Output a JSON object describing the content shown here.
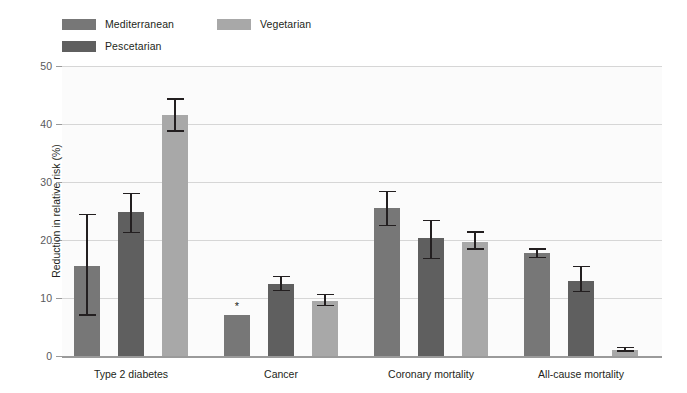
{
  "chart_data": {
    "type": "bar",
    "title": "",
    "xlabel": "",
    "ylabel": "Reduction in relative risk (%)",
    "ylim": [
      0,
      50
    ],
    "yticks": [
      0,
      10,
      20,
      30,
      40,
      50
    ],
    "ytick_labels": [
      "0",
      "10",
      "20",
      "30",
      "40",
      "50"
    ],
    "grid": true,
    "legend_position": "top-left",
    "categories": [
      "Type 2 diabetes",
      "Cancer",
      "Coronary mortality",
      "All-cause mortality"
    ],
    "series": [
      {
        "name": "Mediterranean",
        "color": "#777777",
        "values": [
          15.5,
          7.0,
          25.5,
          17.8
        ],
        "error_low": [
          7.2,
          null,
          22.6,
          17.1
        ],
        "error_high": [
          24.5,
          null,
          28.5,
          18.6
        ],
        "annotations": [
          null,
          "*",
          null,
          null
        ]
      },
      {
        "name": "Pescetarian",
        "color": "#5f5f5f",
        "values": [
          24.8,
          12.4,
          20.3,
          13.0
        ],
        "error_low": [
          21.4,
          11.4,
          16.9,
          11.2
        ],
        "error_high": [
          28.1,
          13.8,
          23.5,
          15.5
        ],
        "annotations": [
          null,
          null,
          null,
          null
        ]
      },
      {
        "name": "Vegetarian",
        "color": "#a8a8a8",
        "values": [
          41.5,
          9.5,
          19.7,
          1.0
        ],
        "error_low": [
          38.9,
          8.8,
          18.6,
          1.0
        ],
        "error_high": [
          44.4,
          10.7,
          21.5,
          1.6
        ],
        "annotations": [
          null,
          null,
          null,
          null
        ]
      }
    ]
  },
  "legend": {
    "items": [
      {
        "label": "Mediterranean",
        "color": "#777777"
      },
      {
        "label": "Pescetarian",
        "color": "#5f5f5f"
      },
      {
        "label": "Vegetarian",
        "color": "#a8a8a8"
      }
    ]
  }
}
